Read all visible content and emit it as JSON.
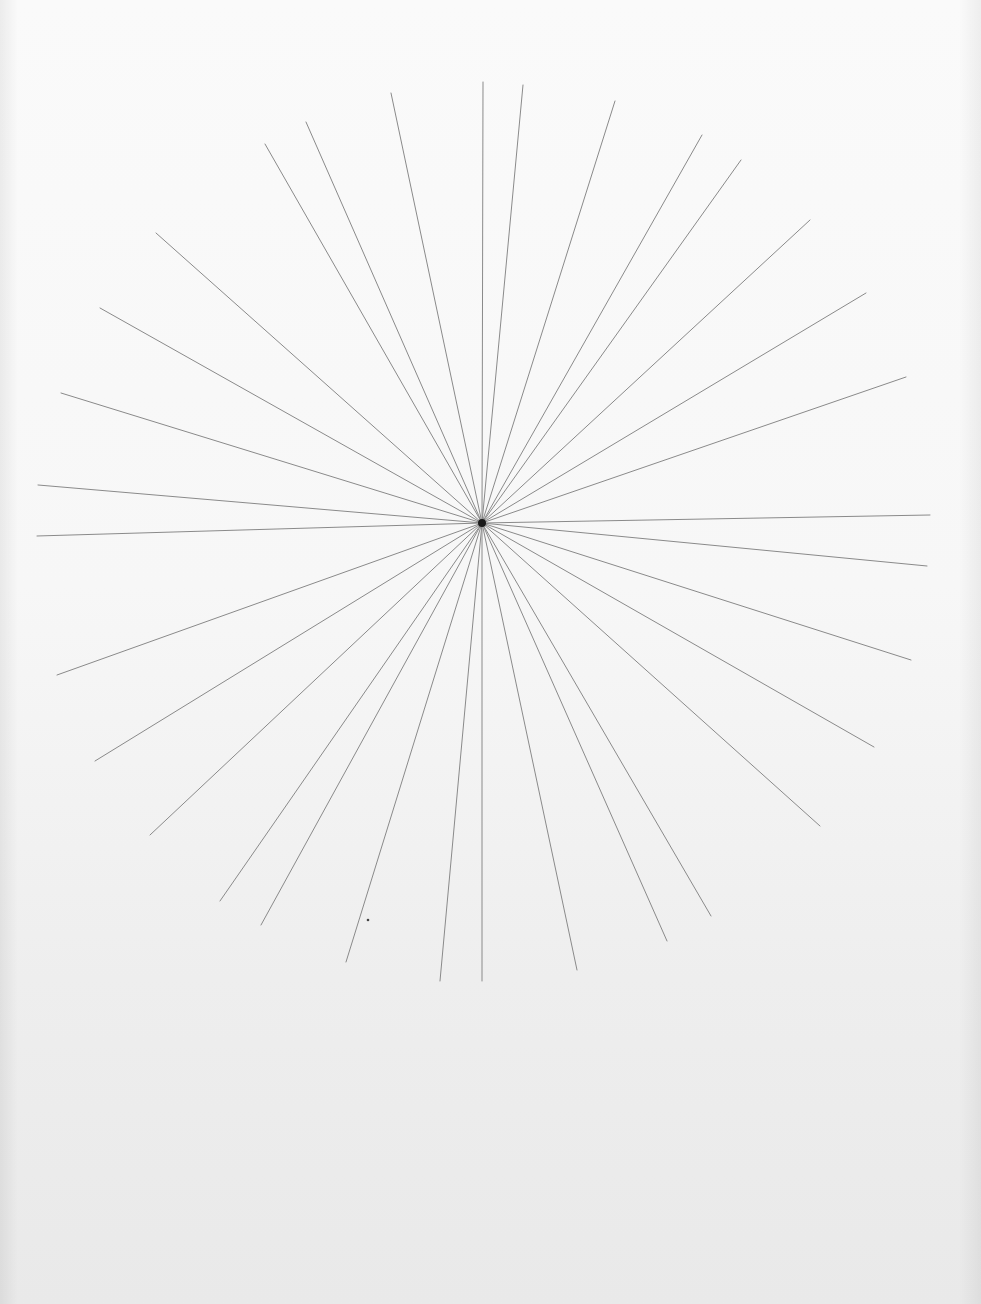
{
  "document": {
    "kind": "scanned pencil drawing",
    "subject": "starburst of radiating lines",
    "paper_color_top": "#fafafa",
    "paper_color_bottom": "#e9e9e9",
    "line_color": "#8a8a8a",
    "center_color": "#1a1a1a"
  },
  "starburst": {
    "center": [
      482,
      523
    ],
    "line_count": 32,
    "endpoints": [
      [
        483,
        82
      ],
      [
        523,
        85
      ],
      [
        391,
        93
      ],
      [
        615,
        101
      ],
      [
        306,
        122
      ],
      [
        265,
        144
      ],
      [
        702,
        135
      ],
      [
        741,
        160
      ],
      [
        156,
        233
      ],
      [
        810,
        220
      ],
      [
        100,
        308
      ],
      [
        866,
        293
      ],
      [
        61,
        393
      ],
      [
        906,
        377
      ],
      [
        38,
        485
      ],
      [
        930,
        515
      ],
      [
        37,
        536
      ],
      [
        927,
        566
      ],
      [
        57,
        675
      ],
      [
        911,
        660
      ],
      [
        95,
        761
      ],
      [
        874,
        747
      ],
      [
        150,
        835
      ],
      [
        820,
        826
      ],
      [
        220,
        901
      ],
      [
        261,
        925
      ],
      [
        711,
        916
      ],
      [
        667,
        941
      ],
      [
        346,
        962
      ],
      [
        577,
        970
      ],
      [
        440,
        981
      ],
      [
        482,
        981
      ]
    ]
  },
  "marks": [
    {
      "type": "dot",
      "pos": [
        368,
        920
      ],
      "r": 1.3
    }
  ]
}
